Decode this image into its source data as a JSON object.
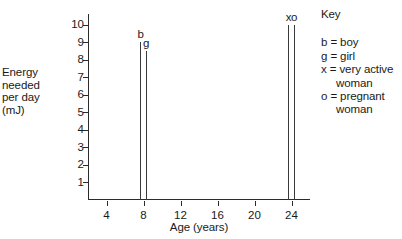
{
  "chart_data": {
    "type": "bar",
    "title": "",
    "xlabel": "Age (years)",
    "ylabel_lines": [
      "Energy",
      "needed",
      "per day",
      "(mJ)"
    ],
    "ylabel": "Energy needed per day (mJ)",
    "xlim": [
      2,
      26
    ],
    "ylim": [
      0,
      10.6
    ],
    "xticks": [
      4,
      8,
      12,
      16,
      20,
      24
    ],
    "yticks": [
      1,
      2,
      3,
      4,
      5,
      6,
      7,
      8,
      9,
      10
    ],
    "grid": false,
    "legend_position": "right",
    "bar_style": "thin-vertical-line",
    "bars": [
      {
        "label": "b",
        "x": 7.7,
        "value": 9.0,
        "description": "boy"
      },
      {
        "label": "g",
        "x": 8.3,
        "value": 8.5,
        "description": "girl"
      },
      {
        "label": "x",
        "x": 23.7,
        "value": 10.0,
        "description": "very active woman"
      },
      {
        "label": "o",
        "x": 24.3,
        "value": 10.0,
        "description": "pregnant woman"
      }
    ],
    "categories": [
      "b",
      "g",
      "x",
      "o"
    ],
    "values": [
      9.0,
      8.5,
      10.0,
      10.0
    ],
    "legend": {
      "title": "Key",
      "entries": [
        {
          "line1": "b = boy",
          "line2": ""
        },
        {
          "line1": "g = girl",
          "line2": ""
        },
        {
          "line1": "x = very active",
          "line2": "woman"
        },
        {
          "line1": "o = pregnant",
          "line2": "woman"
        }
      ]
    }
  }
}
